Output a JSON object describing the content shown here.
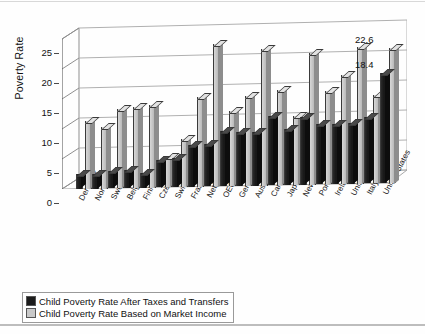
{
  "chart_data": {
    "type": "bar",
    "title": "",
    "xlabel": "",
    "ylabel": "Poverty Rate",
    "ylim": [
      0,
      25
    ],
    "yticks": [
      0,
      5,
      10,
      15,
      20,
      25
    ],
    "grid": true,
    "style": "3d-grouped-bar",
    "legend_position": "bottom-left",
    "categories": [
      "Denmark",
      "Norway",
      "Sweden",
      "Belgium",
      "Finland",
      "Czech Republic",
      "Switzerland",
      "France",
      "Netherlands",
      "OECD Average",
      "Germany",
      "Australia",
      "Canada",
      "Japan",
      "New Zealand",
      "Portugal",
      "Ireland",
      "United Kingdom",
      "Italy",
      "United States"
    ],
    "series": [
      {
        "name": "Child Poverty Rate After Taxes and Transfers",
        "color": "#1c1c1c",
        "values": [
          2.4,
          2.5,
          2.8,
          3.0,
          2.5,
          4.6,
          4.8,
          7.0,
          7.0,
          9.2,
          9.0,
          9.0,
          11.5,
          9.4,
          11.2,
          10.0,
          10.0,
          10.2,
          11.0,
          18.4
        ]
      },
      {
        "name": "Child Poverty Rate Based on Market Income",
        "color": "#c9c9c9",
        "values": [
          11.3,
          10.3,
          13.2,
          13.5,
          13.8,
          5.0,
          8.0,
          15.0,
          23.8,
          12.5,
          15.0,
          22.7,
          15.8,
          11.5,
          22.0,
          15.5,
          18.2,
          22.8,
          14.8,
          22.6
        ]
      }
    ],
    "point_labels": [
      {
        "series": 1,
        "category": "United States",
        "value": "22.6"
      },
      {
        "series": 0,
        "category": "United States",
        "value": "18.4"
      }
    ]
  },
  "legend": {
    "items": [
      {
        "label": "Child Poverty Rate After Taxes and Transfers"
      },
      {
        "label": "Child Poverty Rate Based on Market Income"
      }
    ]
  }
}
